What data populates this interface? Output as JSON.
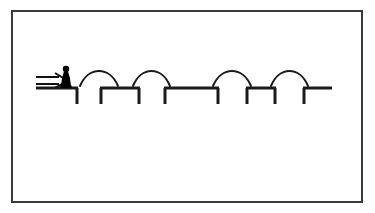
{
  "canvas": {
    "width": 375,
    "height": 213,
    "background_color": "#ffffff",
    "stroke_color": "#1a1a1a",
    "title": "pawn-jumping-over-platform-gaps-diagram"
  },
  "frame": {
    "name": "outer-border-rectangle",
    "x": 12,
    "y": 11,
    "width": 350,
    "height": 191,
    "stroke_color": "#3a3a3a",
    "stroke_width": 2,
    "fill": "none"
  },
  "arrow": {
    "name": "double-line-right-arrow",
    "label": "⇒",
    "x_start": 36,
    "x_end": 68,
    "y": 81,
    "stroke_color": "#111111",
    "stroke_width": 2
  },
  "figure": {
    "name": "pawn-silhouette",
    "center_x": 66,
    "base_y": 88,
    "height": 22,
    "fill_color": "#000000"
  },
  "ground_level_y": 88,
  "leg_bottom_y": 104,
  "platforms": [
    {
      "id": "platform-1",
      "x_start": 36,
      "x_end": 78,
      "has_left_leg": false,
      "has_right_leg": true
    },
    {
      "id": "platform-2",
      "x_start": 100,
      "x_end": 140,
      "has_left_leg": true,
      "has_right_leg": true
    },
    {
      "id": "platform-3",
      "x_start": 164,
      "x_end": 219,
      "has_left_leg": true,
      "has_right_leg": true
    },
    {
      "id": "platform-4",
      "x_start": 246,
      "x_end": 276,
      "has_left_leg": true,
      "has_right_leg": true
    },
    {
      "id": "platform-5",
      "x_start": 303,
      "x_end": 332,
      "has_left_leg": true,
      "has_right_leg": false
    }
  ],
  "arcs": [
    {
      "id": "jump-arc-1",
      "x_start": 80,
      "x_end": 118,
      "peak_height": 18
    },
    {
      "id": "jump-arc-2",
      "x_start": 133,
      "x_end": 170,
      "peak_height": 18
    },
    {
      "id": "jump-arc-3",
      "x_start": 213,
      "x_end": 251,
      "peak_height": 18
    },
    {
      "id": "jump-arc-4",
      "x_start": 271,
      "x_end": 308,
      "peak_height": 18
    }
  ],
  "stroke": {
    "platform_width": 3,
    "leg_width": 3,
    "arc_width": 2
  }
}
